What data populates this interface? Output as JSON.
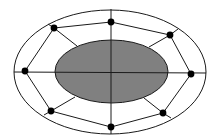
{
  "diagram": {
    "type": "elliptical-ring-network",
    "width": 216,
    "height": 140,
    "colors": {
      "background": "#ffffff",
      "stroke": "#1a1a1a",
      "inner_fill": "#808080",
      "node_fill": "#000000"
    },
    "outer_ellipse": {
      "cx": 110,
      "cy": 72,
      "rx": 96,
      "ry": 62
    },
    "inner_ellipse": {
      "cx": 111.5,
      "cy": 71.5,
      "rx": 56.5,
      "ry": 31.5
    },
    "axes": {
      "horizontal": {
        "x1": 14,
        "y1": 72,
        "x2": 206,
        "y2": 73
      },
      "vertical": {
        "x1": 111,
        "y1": 9,
        "x2": 111,
        "y2": 134
      }
    },
    "node_radius": 3.4,
    "nodes": [
      {
        "id": "top",
        "x": 111,
        "y": 22
      },
      {
        "id": "top-right",
        "x": 170,
        "y": 35
      },
      {
        "id": "right",
        "x": 191,
        "y": 74
      },
      {
        "id": "bottom-right",
        "x": 163,
        "y": 113
      },
      {
        "id": "bottom",
        "x": 111,
        "y": 127
      },
      {
        "id": "bottom-left",
        "x": 51,
        "y": 111
      },
      {
        "id": "left",
        "x": 25,
        "y": 71
      },
      {
        "id": "top-left",
        "x": 54,
        "y": 28
      }
    ],
    "ring_edges": [
      [
        "top",
        "top-right"
      ],
      [
        "top-right",
        "right"
      ],
      [
        "right",
        "bottom-right"
      ],
      [
        "bottom-right",
        "bottom"
      ],
      [
        "bottom",
        "bottom-left"
      ],
      [
        "bottom-left",
        "left"
      ],
      [
        "left",
        "top-left"
      ],
      [
        "top-left",
        "top"
      ]
    ],
    "outer_spokes": [
      {
        "node": "top-left",
        "x2": 48,
        "y2": 24
      },
      {
        "node": "top-right",
        "x2": 178,
        "y2": 29
      },
      {
        "node": "bottom-right",
        "x2": 171,
        "y2": 118
      },
      {
        "node": "bottom-left",
        "x2": 44,
        "y2": 115
      }
    ],
    "inner_spokes": [
      {
        "node": "top-left",
        "x2": 77,
        "y2": 46
      },
      {
        "node": "top-right",
        "x2": 149,
        "y2": 47
      },
      {
        "node": "bottom-right",
        "x2": 144,
        "y2": 98
      },
      {
        "node": "bottom-left",
        "x2": 75,
        "y2": 97
      }
    ]
  }
}
